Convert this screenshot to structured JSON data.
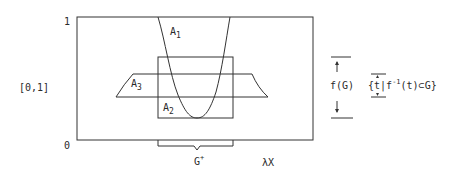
{
  "axes": {
    "y_top_label": "1",
    "y_bottom_label": "0",
    "y_range_label": "[0,1]",
    "x_label": "λX"
  },
  "sets": {
    "a1": {
      "base": "A",
      "sub": "1"
    },
    "a2": {
      "base": "A",
      "sub": "2"
    },
    "a3": {
      "base": "A",
      "sub": "3"
    }
  },
  "brace": {
    "base": "G",
    "sup": "+"
  },
  "right_annotation": {
    "fg_label": "f(G)",
    "set_open": "{",
    "set_var": "t",
    "set_bar": "|",
    "set_f": "f",
    "set_inv": "-1",
    "set_rest": "(t)⊂G}"
  },
  "colors": {
    "stroke": "#333333",
    "text": "#2a2a2a",
    "background": "#ffffff"
  }
}
